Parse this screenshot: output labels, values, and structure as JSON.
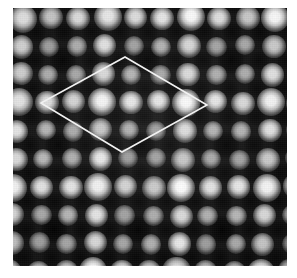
{
  "figure": {
    "kind": "stm-micrograph",
    "caption_text": "",
    "alt_text": "Grayscale scanning-tunneling-microscopy image of a periodic atomic lattice with a rhombic unit cell outlined in white",
    "width_px": 297,
    "height_px": 278
  },
  "page": {
    "background_color": "#ffffff",
    "margins_px": {
      "left": 13,
      "top": 8,
      "right": 10,
      "bottom": 12
    }
  },
  "scan": {
    "frame_px": {
      "x": 13,
      "y": 8,
      "width": 274,
      "height": 258
    },
    "background_color": "#151515",
    "bright_color": "#ffffff",
    "dark_color": "#0a0a0a",
    "noise_opacity": 0.2,
    "lattice": {
      "type": "oblique-hexagonal",
      "a_vector_px": [
        28.0,
        0.0
      ],
      "b_vector_px": [
        -1.5,
        28.2
      ],
      "origin_px": [
        10.0,
        10.0
      ],
      "atom_radius_px": 11.5,
      "rows": 10,
      "cols": 11,
      "brightness_pattern_note": "superstructure: every third site along both axes appears brighter and larger",
      "superperiod": 3
    }
  },
  "unit_cell": {
    "label": "unit cell",
    "shape": "rhombus",
    "stroke_color": "#f2f2f2",
    "stroke_width_px": 1.6,
    "vertices_px": [
      {
        "name": "top",
        "x": 125,
        "y": 57
      },
      {
        "name": "right",
        "x": 207,
        "y": 105
      },
      {
        "name": "bottom",
        "x": 122,
        "y": 152
      },
      {
        "name": "left",
        "x": 41,
        "y": 103
      }
    ],
    "side_lengths_px": [
      95,
      96,
      94,
      95
    ],
    "spans_lattice_periods": 3
  },
  "chart_data": {
    "type": "heatmap",
    "title": "",
    "xlabel": "",
    "ylabel": "",
    "colormap": "grayscale",
    "value_range": [
      0,
      255
    ],
    "note": "Topographic height map; bright maxima are surface atoms, dark minima are interstitial hollows."
  }
}
